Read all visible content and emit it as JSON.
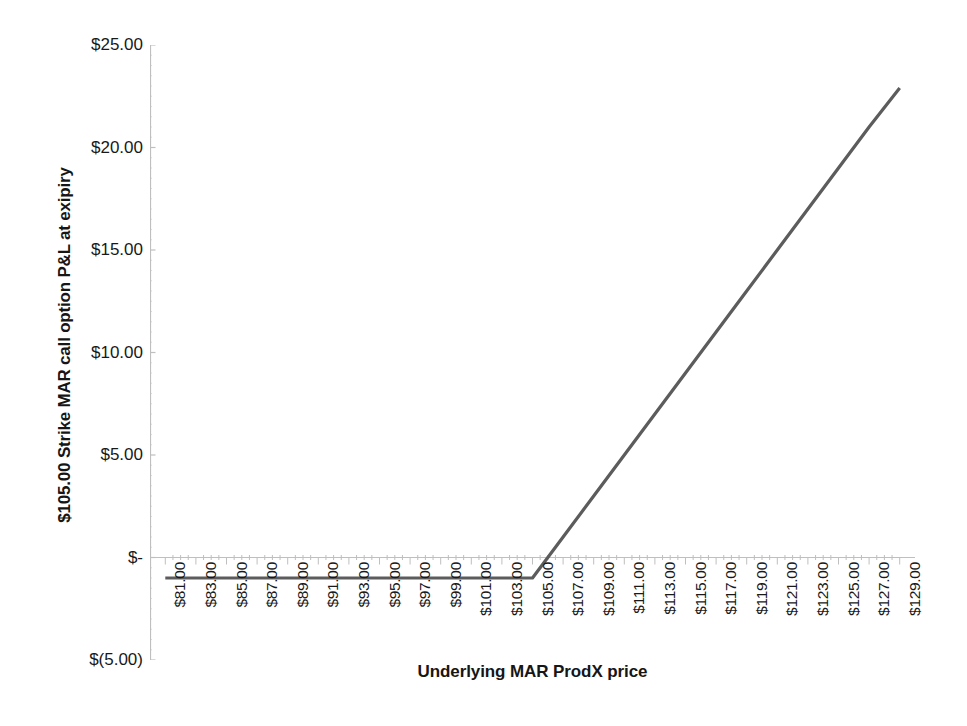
{
  "chart_data": {
    "type": "line",
    "title": "",
    "xlabel": "Underlying MAR ProdX price",
    "ylabel": "$105.00 Strike MAR call option P&L at exipiry",
    "xlim": [
      80,
      130
    ],
    "ylim": [
      -5,
      25
    ],
    "grid": false,
    "legend": "none",
    "line_color": "#5c5c5c",
    "axis_color": "#bfbfbf",
    "y_ticks": [
      -5,
      0,
      5,
      10,
      15,
      20,
      25
    ],
    "y_tick_labels": [
      "$(5.00)",
      "$-",
      "$5.00",
      "$10.00",
      "$15.00",
      "$20.00",
      "$25.00"
    ],
    "x_tick_labels": [
      "$81.00",
      "$83.00",
      "$85.00",
      "$87.00",
      "$89.00",
      "$91.00",
      "$93.00",
      "$95.00",
      "$97.00",
      "$99.00",
      "$101.00",
      "$103.00",
      "$105.00",
      "$107.00",
      "$109.00",
      "$111.00",
      "$113.00",
      "$115.00",
      "$117.00",
      "$119.00",
      "$121.00",
      "$123.00",
      "$125.00",
      "$127.00",
      "$129.00"
    ],
    "x": [
      81,
      83,
      85,
      87,
      89,
      91,
      93,
      95,
      97,
      99,
      101,
      103,
      105,
      107,
      109,
      111,
      113,
      115,
      117,
      119,
      121,
      123,
      125,
      127,
      129
    ],
    "series": [
      {
        "name": "$105.00 Strike MAR call option P&L at expiry",
        "values": [
          -1.0,
          -1.0,
          -1.0,
          -1.0,
          -1.0,
          -1.0,
          -1.0,
          -1.0,
          -1.0,
          -1.0,
          -1.0,
          -1.0,
          -1.0,
          1.0,
          3.0,
          5.0,
          7.0,
          9.0,
          11.0,
          13.0,
          15.0,
          17.0,
          19.0,
          21.0,
          22.9
        ]
      }
    ],
    "annotations": {
      "strike": "$105.00",
      "premium": "-$1.00",
      "breakeven": "$106.00"
    }
  }
}
